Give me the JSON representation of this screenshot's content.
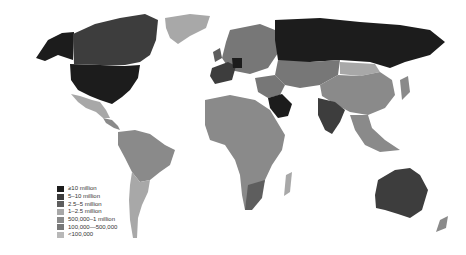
{
  "map": {
    "type": "choropleth world map (grayscale)",
    "legend": {
      "items": [
        {
          "label": "≥10 million",
          "color": "#1c1c1c"
        },
        {
          "label": "5–10 million",
          "color": "#3d3d3d"
        },
        {
          "label": "2.5–5 million",
          "color": "#5e5e5e"
        },
        {
          "label": "1–2.5 million",
          "color": "#a8a8a8"
        },
        {
          "label": "500,000–1 million",
          "color": "#8a8a8a"
        },
        {
          "label": "100,000—500,000",
          "color": "#777777"
        },
        {
          "label": "<100,000",
          "color": "#b8b8b8"
        }
      ]
    },
    "regions": {
      "usa": "#1c1c1c",
      "canada": "#3d3d3d",
      "alaska": "#1c1c1c",
      "mexico": "#a8a8a8",
      "central_america": "#8a8a8a",
      "greenland": "#a8a8a8",
      "russia": "#1c1c1c",
      "europe": "#777777",
      "germany": "#1c1c1c",
      "france_spain": "#3d3d3d",
      "uk": "#5e5e5e",
      "saudi_arabia": "#1c1c1c",
      "middle_east": "#777777",
      "central_asia": "#777777",
      "china": "#8a8a8a",
      "mongolia": "#a8a8a8",
      "india": "#3d3d3d",
      "southeast_asia": "#8a8a8a",
      "australia": "#3d3d3d",
      "new_zealand": "#8a8a8a",
      "south_america": "#8a8a8a",
      "argentina": "#a8a8a8",
      "africa": "#8a8a8a",
      "south_africa": "#5e5e5e",
      "madagascar": "#a8a8a8"
    }
  }
}
